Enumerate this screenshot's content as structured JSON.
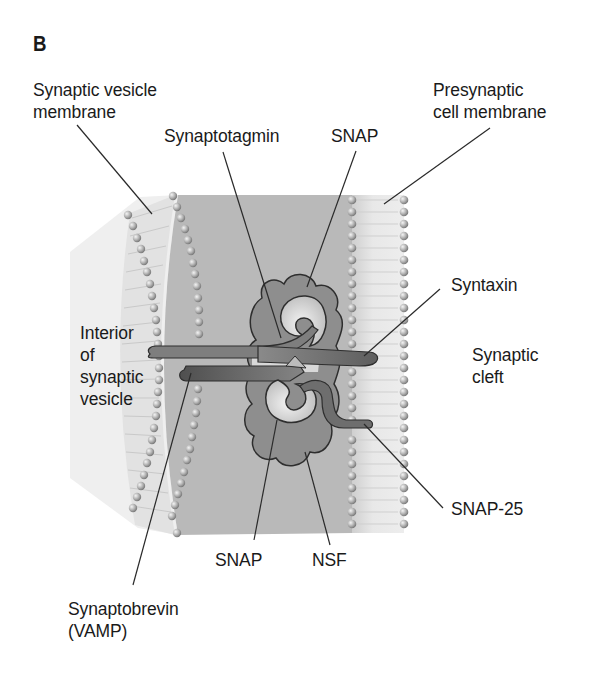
{
  "figure": {
    "panel_letter": "B",
    "labels": {
      "synaptic_vesicle_membrane": [
        "Synaptic vesicle",
        "membrane"
      ],
      "presynaptic_cell_membrane": [
        "Presynaptic",
        "cell membrane"
      ],
      "synaptotagmin": "Synaptotagmin",
      "snap_top": "SNAP",
      "syntaxin": "Syntaxin",
      "interior_of_synaptic_vesicle": [
        "Interior",
        "of",
        "synaptic",
        "vesicle"
      ],
      "synaptic_cleft": [
        "Synaptic",
        "cleft"
      ],
      "snap_25": "SNAP-25",
      "snap_bottom": "SNAP",
      "nsf": "NSF",
      "synaptobrevin": [
        "Synaptobrevin",
        "(VAMP)"
      ]
    },
    "colors": {
      "vesicle_interior": "#efefef",
      "cytoplasm": "#b9b9b9",
      "membrane_band": "#e2e2e2",
      "lipid_head": "#a8a8a8",
      "protein_cloud": "#8e8e8e",
      "snap_light": "#e4e4e4",
      "syntaxin_bar": "#7a7a7a",
      "synaptobrevin_bar": "#5f5f5f",
      "leader_line": "#2a2a2a"
    }
  }
}
